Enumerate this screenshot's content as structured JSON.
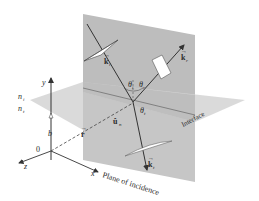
{
  "diagram": {
    "labels": {
      "y_axis": "y",
      "x_axis": "x",
      "z_axis": "z",
      "origin": "0",
      "b": "b",
      "n_i": "n",
      "n_i_sub": "i",
      "n_t": "n",
      "n_t_sub": "t",
      "r_vec": "r",
      "k_i": "k",
      "k_i_sub": "i",
      "k_r": "k",
      "k_r_sub": "r",
      "k_t": "k",
      "k_t_sub": "t",
      "u_n": "û",
      "u_n_sub": "n",
      "theta_i": "θ",
      "theta_i_sub": "i",
      "theta_r": "θ",
      "theta_r_sub": "r",
      "theta_t": "θ",
      "theta_t_sub": "t",
      "interface": "Interface",
      "plane_of_incidence": "Plane of incidence"
    },
    "colors": {
      "background": "#ffffff",
      "vertical_plane": "#b8b8b8",
      "horizontal_plane": "#d6d6d6",
      "overlap": "#a9a9a9",
      "lines": "#333333",
      "wave_front": "#ffffff"
    }
  }
}
